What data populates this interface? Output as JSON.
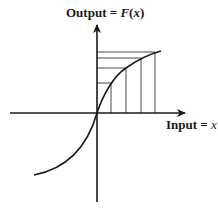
{
  "diagram": {
    "type": "function-graph",
    "y_axis_label": {
      "prefix": "Output = ",
      "func": "F",
      "paren_open": "(",
      "var": "x",
      "paren_close": ")"
    },
    "x_axis_label": {
      "prefix": "Input = ",
      "var": "x"
    },
    "curve": "concave-down increasing through origin, convex below origin (sigmoid-like / compressive)",
    "sample_inputs_px": [
      111,
      126,
      141,
      155
    ],
    "sample_outputs_px": [
      83,
      68,
      58,
      52
    ],
    "stroke_color": "#1a1a1a",
    "background": "#ffffff"
  }
}
